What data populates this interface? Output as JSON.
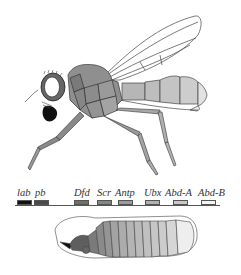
{
  "figure": {
    "subject_top": "adult fruit fly (Drosophila) body segments shaded by Hox gene expression",
    "subject_bottom": "embryo segments shaded by Hox gene expression"
  },
  "hox_cluster": {
    "genes": [
      {
        "label": "lab",
        "color": "#111111",
        "x": 17
      },
      {
        "label": "pb",
        "color": "#4a4a4a",
        "x": 34
      },
      {
        "label": "Dfd",
        "color": "#6e6e6e",
        "x": 74
      },
      {
        "label": "Scr",
        "color": "#848484",
        "x": 97
      },
      {
        "label": "Antp",
        "color": "#9a9a9a",
        "x": 118
      },
      {
        "label": "Ubx",
        "color": "#b0b0b0",
        "x": 145
      },
      {
        "label": "Abd-A",
        "color": "#c8c8c8",
        "x": 173
      },
      {
        "label": "Abd-B",
        "color": "#f4f4f4",
        "x": 201
      }
    ]
  }
}
